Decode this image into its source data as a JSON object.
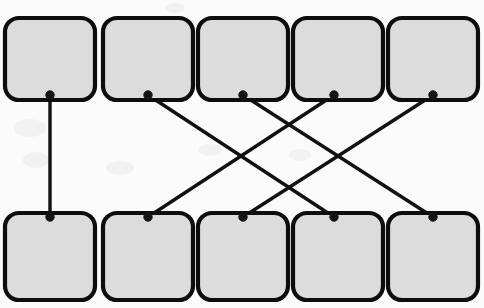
{
  "diagram": {
    "type": "bipartite-graph",
    "canvas": {
      "width": 484,
      "height": 308,
      "background": "#fbfbfb"
    },
    "style": {
      "node_fill": "#dcdcdc",
      "node_stroke": "#0d0d0d",
      "node_stroke_width": 4.2,
      "edge_color": "#111111",
      "edge_width": 3.4,
      "anchor_color": "#141414",
      "node_corner_radius": 14
    },
    "rows": [
      {
        "name": "top-row",
        "label": "top",
        "node_count": 5,
        "box_y": 18,
        "box_height": 82,
        "anchor_y": 95,
        "anchor_side": "bottom"
      },
      {
        "name": "bottom-row",
        "label": "bottom",
        "node_count": 5,
        "box_y": 213,
        "box_height": 87,
        "anchor_y": 217,
        "anchor_side": "top"
      }
    ],
    "columns": [
      {
        "index": 1,
        "box_x": 5,
        "box_width": 90,
        "anchor_x": 50
      },
      {
        "index": 2,
        "box_x": 103,
        "box_width": 90,
        "anchor_x": 148
      },
      {
        "index": 3,
        "box_x": 198,
        "box_width": 90,
        "anchor_x": 243
      },
      {
        "index": 4,
        "box_x": 293,
        "box_width": 90,
        "anchor_x": 334
      },
      {
        "index": 5,
        "box_x": 388,
        "box_width": 90,
        "anchor_x": 433
      }
    ],
    "nodes_top": [
      {
        "id": "top-1",
        "label": "",
        "x": 50,
        "y": 95
      },
      {
        "id": "top-2",
        "label": "",
        "x": 148,
        "y": 95
      },
      {
        "id": "top-3",
        "label": "",
        "x": 243,
        "y": 95
      },
      {
        "id": "top-4",
        "label": "",
        "x": 334,
        "y": 95
      },
      {
        "id": "top-5",
        "label": "",
        "x": 433,
        "y": 95
      }
    ],
    "nodes_bottom": [
      {
        "id": "bottom-1",
        "label": "",
        "x": 50,
        "y": 217
      },
      {
        "id": "bottom-2",
        "label": "",
        "x": 148,
        "y": 217
      },
      {
        "id": "bottom-3",
        "label": "",
        "x": 243,
        "y": 217
      },
      {
        "id": "bottom-4",
        "label": "",
        "x": 334,
        "y": 217
      },
      {
        "id": "bottom-5",
        "label": "",
        "x": 433,
        "y": 217
      }
    ],
    "edges": [
      {
        "id": "edge-1",
        "from": "top-1",
        "to": "bottom-1",
        "x1": 50,
        "y1": 95,
        "x2": 50,
        "y2": 217,
        "kind": "vertical"
      },
      {
        "id": "edge-2",
        "from": "top-2",
        "to": "bottom-4",
        "x1": 148,
        "y1": 95,
        "x2": 334,
        "y2": 217,
        "kind": "down-right"
      },
      {
        "id": "edge-3",
        "from": "top-3",
        "to": "bottom-5",
        "x1": 243,
        "y1": 95,
        "x2": 433,
        "y2": 217,
        "kind": "down-right"
      },
      {
        "id": "edge-4",
        "from": "top-4",
        "to": "bottom-2",
        "x1": 334,
        "y1": 95,
        "x2": 148,
        "y2": 217,
        "kind": "down-left"
      },
      {
        "id": "edge-5",
        "from": "top-5",
        "to": "bottom-3",
        "x1": 433,
        "y1": 95,
        "x2": 243,
        "y2": 217,
        "kind": "down-left"
      }
    ],
    "edge_count": 5,
    "crossing_count": 4
  }
}
